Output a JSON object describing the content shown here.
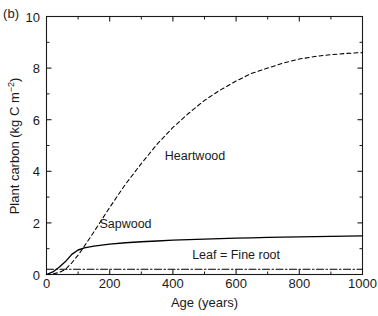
{
  "figure": {
    "panel_label": "(b)",
    "xlabel": "Age (years)",
    "ylabel_main": "Plant carbon (kg C m",
    "ylabel_exponent": "−2",
    "ylabel_close": ")",
    "ylabel_full": "Plant carbon (kg C m−2)"
  },
  "axes": {
    "x_ticks": [
      "0",
      "200",
      "400",
      "600",
      "800",
      "1000"
    ],
    "y_ticks": [
      "0",
      "2",
      "4",
      "6",
      "8",
      "10"
    ]
  },
  "annotations": {
    "heartwood": "Heartwood",
    "sapwood": "Sapwood",
    "leaf_fine_root": "Leaf = Fine root"
  },
  "colors": {
    "axis": "#1a1a1a",
    "curve": "#000000",
    "background": "#ffffff"
  },
  "chart_data": {
    "type": "line",
    "title": "",
    "panel": "(b)",
    "xlabel": "Age (years)",
    "ylabel": "Plant carbon (kg C m-2)",
    "xlim": [
      0,
      1000
    ],
    "ylim": [
      0,
      10
    ],
    "xticks": [
      0,
      200,
      400,
      600,
      800,
      1000
    ],
    "yticks": [
      0,
      2,
      4,
      6,
      8,
      10
    ],
    "xminor": [
      100,
      300,
      500,
      700,
      900
    ],
    "yminor": [
      1,
      3,
      5,
      7,
      9
    ],
    "grid": false,
    "legend": "inline-annotations",
    "frame": "box-all-four-sides-inward-ticks",
    "x": [
      0,
      20,
      40,
      60,
      80,
      100,
      120,
      150,
      200,
      250,
      300,
      350,
      400,
      450,
      500,
      550,
      600,
      650,
      700,
      750,
      800,
      850,
      900,
      950,
      1000
    ],
    "series": [
      {
        "name": "Heartwood",
        "style": "dashed",
        "values": [
          0.0,
          0.02,
          0.08,
          0.2,
          0.45,
          0.75,
          1.1,
          1.65,
          2.6,
          3.5,
          4.3,
          5.05,
          5.7,
          6.25,
          6.75,
          7.15,
          7.5,
          7.8,
          8.0,
          8.2,
          8.35,
          8.45,
          8.52,
          8.57,
          8.6
        ],
        "label_x": 470,
        "label_y": 4.6
      },
      {
        "name": "Sapwood",
        "style": "solid",
        "values": [
          0.0,
          0.1,
          0.28,
          0.5,
          0.78,
          0.95,
          1.03,
          1.1,
          1.18,
          1.23,
          1.27,
          1.3,
          1.33,
          1.35,
          1.37,
          1.39,
          1.41,
          1.42,
          1.44,
          1.45,
          1.46,
          1.47,
          1.48,
          1.49,
          1.5
        ],
        "label_x": 250,
        "label_y": 1.95
      },
      {
        "name": "Leaf = Fine root",
        "style": "dash-dot",
        "values": [
          0.2,
          0.2,
          0.2,
          0.2,
          0.2,
          0.2,
          0.2,
          0.2,
          0.2,
          0.2,
          0.2,
          0.2,
          0.2,
          0.2,
          0.2,
          0.2,
          0.2,
          0.2,
          0.2,
          0.2,
          0.2,
          0.2,
          0.2,
          0.2,
          0.2
        ],
        "label_x": 600,
        "label_y": 0.75
      }
    ]
  }
}
